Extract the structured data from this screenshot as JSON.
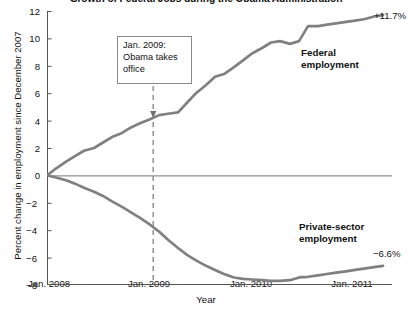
{
  "chart_data": {
    "type": "line",
    "title": "Growth of Federal Jobs during the Obama Administration",
    "xlabel": "Year",
    "ylabel": "Percent change in employment since December 2007",
    "xlim": [
      2008.0,
      2011.08
    ],
    "ylim": [
      -8,
      12
    ],
    "yticks": [
      -8,
      -6,
      -4,
      -2,
      0,
      2,
      4,
      6,
      8,
      10,
      12
    ],
    "ytick_labels": [
      "−8",
      "−6",
      "−4",
      "−2",
      "0",
      "2",
      "4",
      "6",
      "8",
      "10",
      "12"
    ],
    "xticks": [
      2008.0,
      2009.0,
      2010.0,
      2011.0
    ],
    "xtick_labels": [
      "Jan. 2008",
      "Jan. 2009",
      "Jan. 2010",
      "Jan. 2011"
    ],
    "grid": false,
    "legend": "inline-labels",
    "zero_line": true,
    "line_color": "#808080",
    "axis_color": "#555555",
    "series": [
      {
        "name": "Federal employment",
        "label_text_line1": "Federal",
        "label_text_line2": "employment",
        "end_label": "+11.7%",
        "end_value": 11.7,
        "x": [
          2008.0,
          2008.08,
          2008.17,
          2008.25,
          2008.33,
          2008.42,
          2008.5,
          2008.58,
          2008.67,
          2008.75,
          2008.83,
          2008.92,
          2009.0,
          2009.08,
          2009.17,
          2009.25,
          2009.33,
          2009.42,
          2009.5,
          2009.58,
          2009.67,
          2009.75,
          2009.83,
          2009.92,
          2010.0,
          2010.08,
          2010.17,
          2010.25,
          2010.33,
          2010.42,
          2010.5,
          2010.58,
          2010.67,
          2010.75,
          2010.83,
          2010.92,
          2011.0
        ],
        "values": [
          0.0,
          0.5,
          1.0,
          1.4,
          1.8,
          2.0,
          2.4,
          2.8,
          3.1,
          3.5,
          3.8,
          4.1,
          4.4,
          4.5,
          4.6,
          5.3,
          6.0,
          6.6,
          7.2,
          7.4,
          7.9,
          8.4,
          8.9,
          9.3,
          9.7,
          9.8,
          9.6,
          9.8,
          10.9,
          10.9,
          11.0,
          11.1,
          11.2,
          11.3,
          11.4,
          11.6,
          11.7
        ]
      },
      {
        "name": "Private-sector employment",
        "label_text_line1": "Private-sector",
        "label_text_line2": "employment",
        "end_label": "−6.6%",
        "end_value": -6.6,
        "x": [
          2008.0,
          2008.08,
          2008.17,
          2008.25,
          2008.33,
          2008.42,
          2008.5,
          2008.58,
          2008.67,
          2008.75,
          2008.83,
          2008.92,
          2009.0,
          2009.08,
          2009.17,
          2009.25,
          2009.33,
          2009.42,
          2009.5,
          2009.58,
          2009.67,
          2009.75,
          2009.83,
          2009.92,
          2010.0,
          2010.08,
          2010.17,
          2010.25,
          2010.33,
          2010.42,
          2010.5,
          2010.58,
          2010.67,
          2010.75,
          2010.83,
          2010.92,
          2011.0
        ],
        "values": [
          0.0,
          -0.15,
          -0.35,
          -0.6,
          -0.9,
          -1.2,
          -1.5,
          -1.9,
          -2.3,
          -2.7,
          -3.1,
          -3.6,
          -4.1,
          -4.7,
          -5.3,
          -5.8,
          -6.2,
          -6.6,
          -6.9,
          -7.2,
          -7.45,
          -7.55,
          -7.6,
          -7.65,
          -7.7,
          -7.7,
          -7.65,
          -7.45,
          -7.4,
          -7.3,
          -7.2,
          -7.1,
          -7.0,
          -6.9,
          -6.8,
          -6.7,
          -6.6
        ]
      }
    ],
    "annotation": {
      "line1": "Jan. 2009:",
      "line2": "Obama takes",
      "line3": "office",
      "at_x": 2009.0,
      "at_y": 4.4,
      "style": "dashed-vertical-line-with-arrow"
    }
  }
}
